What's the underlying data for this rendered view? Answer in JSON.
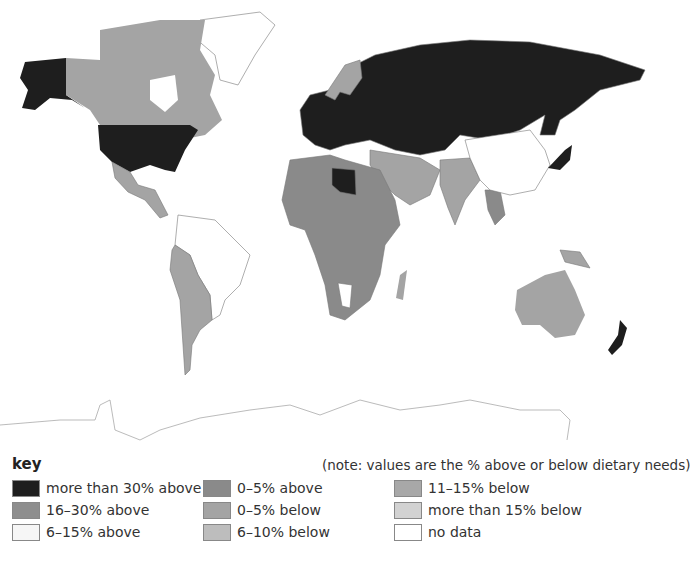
{
  "legend": {
    "title": "key",
    "note": "(note: values are the % above or below dietary needs)",
    "items": [
      {
        "label": "more than 30% above",
        "color": "#1e1e1e"
      },
      {
        "label": "16–30% above",
        "color": "#8e8e8e"
      },
      {
        "label": "6–15% above",
        "color": "#f6f6f6"
      },
      {
        "label": "0–5% above",
        "color": "#8a8a8a"
      },
      {
        "label": "0–5% below",
        "color": "#a4a4a4"
      },
      {
        "label": "6–10% below",
        "color": "#bdbdbd"
      },
      {
        "label": "11–15% below",
        "color": "#a8a8a8"
      },
      {
        "label": "more than 15% below",
        "color": "#d2d2d2"
      },
      {
        "label": "no data",
        "color": "#ffffff"
      }
    ]
  },
  "map": {
    "regions": [
      {
        "name": "Alaska",
        "category": "more than 30% above"
      },
      {
        "name": "Canada",
        "category": "0–5% below"
      },
      {
        "name": "USA",
        "category": "more than 30% above"
      },
      {
        "name": "Mexico & Central America",
        "category": "0–5% below"
      },
      {
        "name": "South America (north)",
        "category": "no data"
      },
      {
        "name": "South America (west/south)",
        "category": "0–5% below"
      },
      {
        "name": "Europe & Russia",
        "category": "more than 30% above"
      },
      {
        "name": "Scandinavia",
        "category": "0–5% below"
      },
      {
        "name": "Libya",
        "category": "more than 30% above"
      },
      {
        "name": "Africa",
        "category": "0–5% above"
      },
      {
        "name": "Middle East",
        "category": "0–5% below"
      },
      {
        "name": "India",
        "category": "0–5% below"
      },
      {
        "name": "China & East Asia",
        "category": "no data"
      },
      {
        "name": "Japan",
        "category": "more than 30% above"
      },
      {
        "name": "Australia",
        "category": "0–5% below"
      },
      {
        "name": "New Zealand",
        "category": "more than 30% above"
      },
      {
        "name": "Antarctica",
        "category": "no data"
      }
    ]
  }
}
